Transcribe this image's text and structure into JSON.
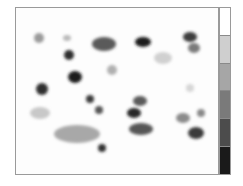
{
  "chart_data": {
    "type": "heatmap",
    "title": "",
    "xlabel": "",
    "ylabel": "",
    "grid": false,
    "legend_position": "right (colorbar)",
    "colorbar": {
      "levels": 6,
      "colors": [
        "#ffffff",
        "#cfcfcf",
        "#a6a6a6",
        "#7a7a7a",
        "#4c4c4c",
        "#1a1a1a"
      ]
    },
    "plot_area": {
      "x": 15,
      "y": 7,
      "width": 204,
      "height": 168
    },
    "spots": [
      {
        "cx": 38,
        "cy": 37,
        "rx": 5,
        "ry": 5,
        "color": "#9a9a9a"
      },
      {
        "cx": 66,
        "cy": 37,
        "rx": 4,
        "ry": 3,
        "color": "#b8b8b8"
      },
      {
        "cx": 103,
        "cy": 43,
        "rx": 12,
        "ry": 7,
        "color": "#5a5a5a"
      },
      {
        "cx": 142,
        "cy": 41,
        "rx": 8,
        "ry": 5,
        "color": "#1e1e1e"
      },
      {
        "cx": 189,
        "cy": 36,
        "rx": 7,
        "ry": 5,
        "color": "#3c3c3c"
      },
      {
        "cx": 193,
        "cy": 47,
        "rx": 6,
        "ry": 5,
        "color": "#7a7a7a"
      },
      {
        "cx": 162,
        "cy": 57,
        "rx": 9,
        "ry": 6,
        "color": "#d0d0d0"
      },
      {
        "cx": 68,
        "cy": 54,
        "rx": 5,
        "ry": 5,
        "color": "#2e2e2e"
      },
      {
        "cx": 111,
        "cy": 69,
        "rx": 5,
        "ry": 5,
        "color": "#b0b0b0"
      },
      {
        "cx": 74,
        "cy": 76,
        "rx": 7,
        "ry": 6,
        "color": "#1e1e1e"
      },
      {
        "cx": 41,
        "cy": 88,
        "rx": 6,
        "ry": 6,
        "color": "#2e2e2e"
      },
      {
        "cx": 189,
        "cy": 87,
        "rx": 4,
        "ry": 4,
        "color": "#d6d6d6"
      },
      {
        "cx": 89,
        "cy": 98,
        "rx": 4,
        "ry": 4,
        "color": "#3a3a3a"
      },
      {
        "cx": 98,
        "cy": 109,
        "rx": 4,
        "ry": 4,
        "color": "#555555"
      },
      {
        "cx": 139,
        "cy": 100,
        "rx": 7,
        "ry": 5,
        "color": "#5a5a5a"
      },
      {
        "cx": 133,
        "cy": 112,
        "rx": 7,
        "ry": 5,
        "color": "#262626"
      },
      {
        "cx": 39,
        "cy": 112,
        "rx": 10,
        "ry": 6,
        "color": "#c8c8c8"
      },
      {
        "cx": 182,
        "cy": 117,
        "rx": 7,
        "ry": 5,
        "color": "#8a8a8a"
      },
      {
        "cx": 200,
        "cy": 112,
        "rx": 4,
        "ry": 4,
        "color": "#888888"
      },
      {
        "cx": 140,
        "cy": 128,
        "rx": 12,
        "ry": 6,
        "color": "#565656"
      },
      {
        "cx": 195,
        "cy": 132,
        "rx": 8,
        "ry": 6,
        "color": "#3a3a3a"
      },
      {
        "cx": 76,
        "cy": 133,
        "rx": 23,
        "ry": 9,
        "color": "#a8a8a8"
      },
      {
        "cx": 101,
        "cy": 147,
        "rx": 4,
        "ry": 4,
        "color": "#333333"
      }
    ]
  }
}
